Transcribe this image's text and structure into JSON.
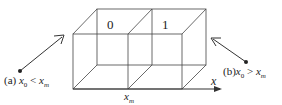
{
  "diagram": {
    "cells": [
      {
        "label": "0"
      },
      {
        "label": "1"
      }
    ],
    "axis": {
      "label": "x"
    },
    "boundary": {
      "var": "x",
      "sub": "m"
    },
    "point_a": {
      "prefix": "(a)",
      "var": "x",
      "sub": "0",
      "relation": "<",
      "rhs": "x",
      "rhs_sub": "m"
    },
    "point_b": {
      "prefix": "(b)",
      "var": "x",
      "sub": "0",
      "relation": ">",
      "rhs": "x",
      "rhs_sub": "m"
    },
    "colors": {
      "line": "#333333"
    }
  }
}
